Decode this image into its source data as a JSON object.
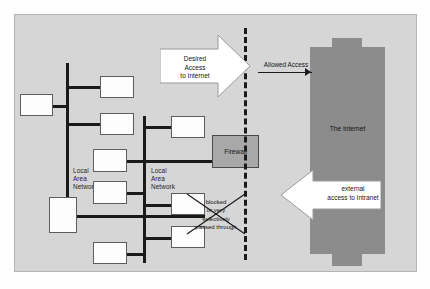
{
  "diagram": {
    "panel_bg": "#d6d6d6",
    "internet_color": "#8c8c8c",
    "firewall_color": "#a8a8a8",
    "line_color": "#1a1a1a"
  },
  "lan_left": {
    "label": "Local\nArea\nNetwork",
    "node_count": 4
  },
  "lan_right": {
    "label": "Local\nArea\nNetwork",
    "node_count": 7
  },
  "firewall": {
    "label": "Firewall"
  },
  "internet": {
    "label": "The\nInternet"
  },
  "arrows": {
    "desired": "Desired\nAccess\nto Internet",
    "allowed": "Allowed Access",
    "external": "external\naccess to Intranet"
  },
  "annotation": {
    "blocked": "blocked\nor very\nselectively\npassed through"
  }
}
